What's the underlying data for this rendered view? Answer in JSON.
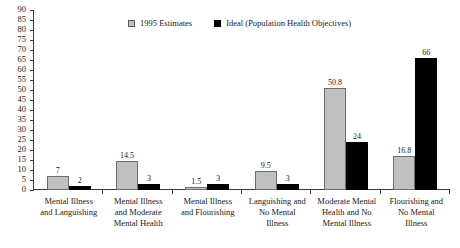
{
  "chart_data": {
    "type": "bar",
    "title": "",
    "xlabel": "",
    "ylabel": "",
    "ylim": [
      0,
      90
    ],
    "ytick_step": 5,
    "grid": false,
    "legend_position": "top-center",
    "categories": [
      "Mental Illness and Languishing",
      "Mental Illness and Moderate Mental Health",
      "Mental Illness and Flourishing",
      "Languishing and No Mental Illness",
      "Moderate Mental Health and No Mental Illness",
      "Flourishing and No Mental Illness"
    ],
    "category_lines": [
      [
        "Mental Illness",
        "and Languishing"
      ],
      [
        "Mental Illness",
        "and Moderate",
        "Mental Health"
      ],
      [
        "Mental Illness",
        "and Flourishing"
      ],
      [
        "Languishing and",
        "No Mental",
        "Illness"
      ],
      [
        "Moderate Mental",
        "Health and No",
        "Mental Illness"
      ],
      [
        "Flourishing and",
        "No Mental",
        "Illness"
      ]
    ],
    "series": [
      {
        "name": "1995 Estimates",
        "color": "#c0c0c0",
        "values": [
          7,
          14.5,
          1.5,
          9.5,
          50.8,
          16.8
        ],
        "labels": [
          "7",
          "14.5",
          "1.5",
          "9.5",
          "50.8",
          "16.8"
        ]
      },
      {
        "name": "Ideal (Population Health Objectives)",
        "color": "#000000",
        "values": [
          2,
          3,
          3,
          3,
          24,
          66
        ],
        "labels": [
          "2",
          "3",
          "3",
          "3",
          "24",
          "66"
        ]
      }
    ],
    "yticks": [
      "90",
      "85",
      "80",
      "75",
      "70",
      "65",
      "60",
      "55",
      "50",
      "45",
      "40",
      "35",
      "30",
      "25",
      "20",
      "15",
      "10",
      "5",
      "0"
    ]
  }
}
